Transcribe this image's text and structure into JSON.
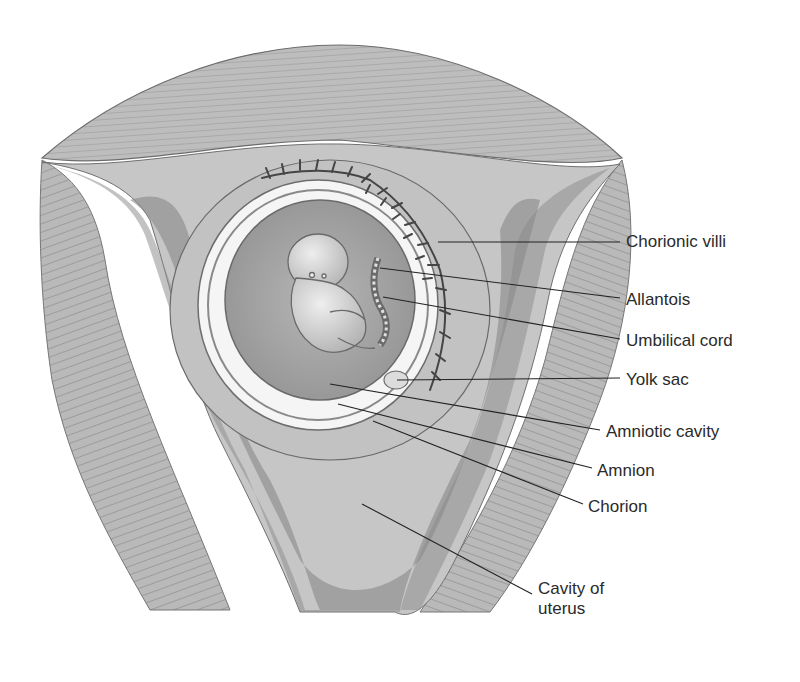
{
  "diagram": {
    "colors": {
      "background": "#ffffff",
      "muscle": "#b8b8b8",
      "muscle_stripe": "#9a9a9a",
      "endometrium": "#c9c9c9",
      "cavity": "#8f8f8f",
      "chorion_zone": "#bdbdbd",
      "amnion_white": "#f4f4f4",
      "amniotic_fluid": "#a8a8a8",
      "embryo": "#d6d6d6",
      "villi": "#4a4a4a",
      "leader_line": "#222222",
      "text": "#2a2a2a"
    },
    "labels": [
      {
        "id": "chorionic-villi",
        "text": "Chorionic villi",
        "x": 626,
        "y": 232,
        "line": [
          438,
          242,
          620,
          242
        ]
      },
      {
        "id": "allantois",
        "text": "Allantois",
        "x": 626,
        "y": 290,
        "line": [
          380,
          268,
          620,
          298
        ]
      },
      {
        "id": "umbilical-cord",
        "text": "Umbilical cord",
        "x": 626,
        "y": 331,
        "line": [
          383,
          297,
          620,
          339
        ]
      },
      {
        "id": "yolk-sac",
        "text": "Yolk sac",
        "x": 626,
        "y": 370,
        "line": [
          397,
          380,
          620,
          378
        ]
      },
      {
        "id": "amniotic-cavity",
        "text": "Amniotic cavity",
        "x": 606,
        "y": 422,
        "line": [
          330,
          384,
          600,
          430
        ]
      },
      {
        "id": "amnion",
        "text": "Amnion",
        "x": 597,
        "y": 461,
        "line": [
          338,
          404,
          592,
          468
        ]
      },
      {
        "id": "chorion",
        "text": "Chorion",
        "x": 588,
        "y": 497,
        "line": [
          373,
          421,
          583,
          504
        ]
      },
      {
        "id": "cavity-of-uterus",
        "text": "Cavity of\nuterus",
        "x": 584,
        "y": 579,
        "line": [
          362,
          504,
          532,
          594
        ]
      }
    ]
  }
}
